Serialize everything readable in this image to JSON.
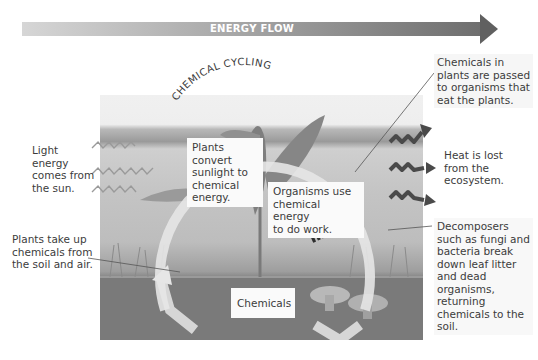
{
  "banner": {
    "label": "ENERGY FLOW",
    "color_start": "#d6d6d6",
    "color_end": "#606060"
  },
  "cycle": {
    "title": "CHEMICAL CYCLING"
  },
  "labels": {
    "light_energy": "Light energy comes from the sun.",
    "light_energy_lines": [
      "Light",
      "energy",
      "comes from",
      "the sun."
    ],
    "plants_take_up": [
      "Plants take up",
      "chemicals from",
      "the soil and air."
    ],
    "chemicals_passed": [
      "Chemicals in",
      "plants are passed",
      "to organisms that",
      "eat the plants."
    ],
    "heat_lost": [
      "Heat is lost",
      "from the",
      "ecosystem."
    ],
    "decomposers": [
      "Decomposers",
      "such as fungi and",
      "bacteria break",
      "down leaf litter",
      "and dead",
      "organisms,",
      "returning",
      "chemicals to the",
      "soil."
    ]
  },
  "boxes": {
    "plants_convert": [
      "Plants",
      "convert",
      "sunlight to",
      "chemical",
      "energy."
    ],
    "organisms_use": [
      "Organisms use",
      "chemical energy",
      "to do work."
    ],
    "chemicals": "Chemicals"
  },
  "icons": {
    "light_arrows": "zigzag-arrow-light",
    "heat_arrows": "zigzag-arrow-heat"
  }
}
